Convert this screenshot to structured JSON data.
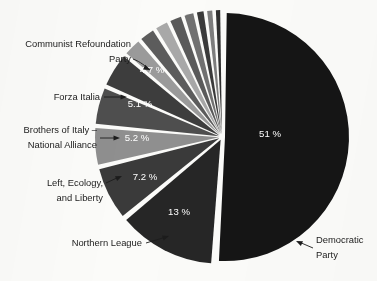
{
  "chart_data": {
    "type": "pie",
    "title": "",
    "subtitle": "",
    "xlabel": "",
    "ylabel": "",
    "legend_position": "callout-labels",
    "grid": false,
    "units": "%",
    "background_color": "#fbfbf9",
    "label_color": "#1c1c1c",
    "value_label_color": "#ffffff",
    "categories": [
      "Democratic Party",
      "Northern League",
      "Left, Ecology, and Liberty",
      "Brothers of Italy – National Alliance",
      "Forza Italia",
      "Communist Refoundation Party",
      "Other party 7",
      "Other party 8",
      "Other party 9",
      "Other party 10",
      "Other party 11",
      "Other party 12",
      "Other party 13",
      "Other party 14"
    ],
    "values": [
      51,
      13,
      7.2,
      5.2,
      5.1,
      4.7,
      2.6,
      2.3,
      2.0,
      1.9,
      1.6,
      1.3,
      1.1,
      1.0
    ],
    "colors": [
      "#151515",
      "#262626",
      "#3a3a3a",
      "#8f8f8f",
      "#4e4e4e",
      "#3d3d3d",
      "#9a9a9a",
      "#5c5c5c",
      "#a8a8a8",
      "#5a5a5a",
      "#707070",
      "#3a3a3a",
      "#7d7d7d",
      "#2f2f2f"
    ],
    "slices": [
      {
        "label": "Democratic Party",
        "value": 51,
        "value_label": "51 %",
        "callout": true,
        "callout_lines": [
          "Democratic",
          "Party"
        ]
      },
      {
        "label": "Northern League",
        "value": 13,
        "value_label": "13 %",
        "callout": true,
        "callout_lines": [
          "Northern League"
        ]
      },
      {
        "label": "Left, Ecology, and Liberty",
        "value": 7.2,
        "value_label": "7.2 %",
        "callout": true,
        "callout_lines": [
          "Left, Ecology,",
          "and Liberty"
        ]
      },
      {
        "label": "Brothers of Italy – National Alliance",
        "value": 5.2,
        "value_label": "5.2 %",
        "callout": true,
        "callout_lines": [
          "Brothers of Italy –",
          "National Alliance"
        ]
      },
      {
        "label": "Forza Italia",
        "value": 5.1,
        "value_label": "5.1 %",
        "callout": true,
        "callout_lines": [
          "Forza Italia"
        ]
      },
      {
        "label": "Communist Refoundation Party",
        "value": 4.7,
        "value_label": "4.7 %",
        "callout": true,
        "callout_lines": [
          "Communist Refoundation",
          "Party"
        ]
      },
      {
        "label": "Other party 7",
        "value": 2.6,
        "value_label": "",
        "callout": false,
        "callout_lines": []
      },
      {
        "label": "Other party 8",
        "value": 2.3,
        "value_label": "",
        "callout": false,
        "callout_lines": []
      },
      {
        "label": "Other party 9",
        "value": 2.0,
        "value_label": "",
        "callout": false,
        "callout_lines": []
      },
      {
        "label": "Other party 10",
        "value": 1.9,
        "value_label": "",
        "callout": false,
        "callout_lines": []
      },
      {
        "label": "Other party 11",
        "value": 1.6,
        "value_label": "",
        "callout": false,
        "callout_lines": []
      },
      {
        "label": "Other party 12",
        "value": 1.3,
        "value_label": "",
        "callout": false,
        "callout_lines": []
      },
      {
        "label": "Other party 13",
        "value": 1.1,
        "value_label": "",
        "callout": false,
        "callout_lines": []
      },
      {
        "label": "Other party 14",
        "value": 1.0,
        "value_label": "",
        "callout": false,
        "callout_lines": []
      }
    ]
  },
  "geometry": {
    "center_x": 222,
    "center_y": 137,
    "radius": 124,
    "start_angle_deg": -90,
    "gap_deg": 1.6,
    "explode": 3
  },
  "callouts": [
    {
      "name": "communist-refoundation-party",
      "lines": [
        "Communist Refoundation",
        "Party"
      ],
      "anchor": "end",
      "x": 131,
      "y": 47,
      "line_height": 15,
      "leader": "M 133 59 C 141 62 145 66 150 70",
      "arrow": [
        150,
        70,
        26
      ]
    },
    {
      "name": "forza-italia",
      "lines": [
        "Forza Italia"
      ],
      "anchor": "end",
      "x": 100,
      "y": 100,
      "line_height": 15,
      "leader": "M 104 97 L 124 97",
      "arrow": [
        127,
        97,
        0
      ]
    },
    {
      "name": "brothers-of-italy-national-alliance",
      "lines": [
        "Brothers of Italy –",
        "National Alliance"
      ],
      "anchor": "end",
      "x": 97,
      "y": 133,
      "line_height": 15,
      "leader": "M 100 138 L 117 138",
      "arrow": [
        120,
        138,
        0
      ]
    },
    {
      "name": "left-ecology-and-liberty",
      "lines": [
        "Left, Ecology,",
        "and Liberty"
      ],
      "anchor": "end",
      "x": 103,
      "y": 186,
      "line_height": 15,
      "leader": "M 106 183 L 119 177",
      "arrow": [
        122,
        176,
        -24
      ]
    },
    {
      "name": "northern-league",
      "lines": [
        "Northern League"
      ],
      "anchor": "end",
      "x": 142,
      "y": 246,
      "line_height": 15,
      "leader": "M 146 243 L 166 237",
      "arrow": [
        169,
        236,
        -18
      ]
    },
    {
      "name": "democratic-party",
      "lines": [
        "Democratic",
        "Party"
      ],
      "anchor": "start",
      "x": 316,
      "y": 243,
      "line_height": 15,
      "leader": "M 313 248 L 299 242",
      "arrow": [
        296,
        241,
        204
      ]
    }
  ],
  "value_labels": [
    {
      "name": "pct-democratic-party",
      "text": "51 %",
      "x": 270,
      "y": 137,
      "anchor": "middle"
    },
    {
      "name": "pct-northern-league",
      "text": "13 %",
      "x": 179,
      "y": 215,
      "anchor": "middle"
    },
    {
      "name": "pct-left-ecology-and-liberty",
      "text": "7.2 %",
      "x": 145,
      "y": 180,
      "anchor": "middle"
    },
    {
      "name": "pct-brothers-of-italy",
      "text": "5.2 %",
      "x": 137,
      "y": 141,
      "anchor": "middle"
    },
    {
      "name": "pct-forza-italia",
      "text": "5.1 %",
      "x": 140,
      "y": 107,
      "anchor": "middle"
    },
    {
      "name": "pct-communist-refoundation-party",
      "text": "4.7 %",
      "x": 152,
      "y": 73,
      "anchor": "middle"
    }
  ]
}
